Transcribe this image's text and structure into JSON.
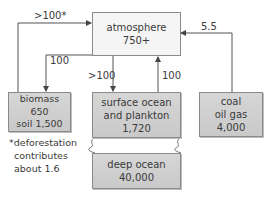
{
  "diagram": {
    "colors": {
      "atmosphere_fill": "#f5f5f5",
      "reservoir_fill": "#cfcfcf",
      "line": "#555555",
      "text": "#3a3a3a"
    },
    "nodes": {
      "atmosphere": {
        "name": "atmosphere",
        "value": "750+"
      },
      "biomass": {
        "name": "biomass",
        "value": "650",
        "extra": "soil 1,500"
      },
      "surface_ocean": {
        "line1": "surface ocean",
        "line2": "and plankton",
        "value": "1,720"
      },
      "fossil": {
        "line1": "coal",
        "line2": "oil gas",
        "value": "4,000"
      },
      "deep_ocean": {
        "name": "deep ocean",
        "value": "40,000"
      }
    },
    "fluxes": {
      "biomass_to_atmosphere": ">100*",
      "atmosphere_to_biomass": "100",
      "atmosphere_to_ocean": ">100",
      "ocean_to_atmosphere": "100",
      "fossil_to_atmosphere": "5.5"
    },
    "footnote": {
      "line1": "*deforestation",
      "line2": "contributes",
      "line3": "about 1.6"
    }
  }
}
